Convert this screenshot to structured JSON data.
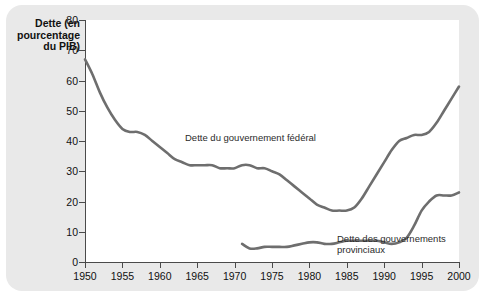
{
  "figure": {
    "background_color": "#e9e9e9",
    "plot_background_color": "#ffffff",
    "line_color": "#6e6e6e",
    "axis_color": "#4a4a4a"
  },
  "chart_data": {
    "type": "line",
    "title": "",
    "ylabel": "Dette (en pourcentage du PIB)",
    "xlabel": "",
    "xlim": [
      1950,
      2000
    ],
    "ylim": [
      0,
      80
    ],
    "grid": false,
    "legend": "inline-annotations",
    "ytick_labels": [
      "0",
      "10",
      "20",
      "30",
      "40",
      "50",
      "60",
      "70",
      "80"
    ],
    "ytick_values": [
      0,
      10,
      20,
      30,
      40,
      50,
      60,
      70,
      80
    ],
    "xtick_labels": [
      "1950",
      "1955",
      "1960",
      "1965",
      "1970",
      "1975",
      "1980",
      "1985",
      "1990",
      "1995",
      "2000"
    ],
    "xtick_values": [
      1950,
      1955,
      1960,
      1965,
      1970,
      1975,
      1980,
      1985,
      1990,
      1995,
      2000
    ],
    "annotations": [
      {
        "name": "federal-label",
        "text": "Dette du gouvernement fédéral",
        "x": 1968,
        "y": 50
      },
      {
        "name": "provincial-label",
        "text": "Dette des gouvernements\nprovinciaux",
        "x": 1989,
        "y": 11
      }
    ],
    "series": [
      {
        "name": "Dette du gouvernement fédéral",
        "x": [
          1950,
          1951,
          1952,
          1953,
          1954,
          1955,
          1956,
          1957,
          1958,
          1959,
          1960,
          1961,
          1962,
          1963,
          1964,
          1965,
          1966,
          1967,
          1968,
          1969,
          1970,
          1971,
          1972,
          1973,
          1974,
          1975,
          1976,
          1977,
          1978,
          1979,
          1980,
          1981,
          1982,
          1983,
          1984,
          1985,
          1986,
          1987,
          1988,
          1989,
          1990,
          1991,
          1992,
          1993,
          1994,
          1995,
          1996,
          1997,
          1998,
          1999,
          2000
        ],
        "values": [
          67,
          62,
          56,
          51,
          47,
          44,
          43,
          43,
          42,
          40,
          38,
          36,
          34,
          33,
          32,
          32,
          32,
          32,
          31,
          31,
          31,
          32,
          32,
          31,
          31,
          30,
          29,
          27,
          25,
          23,
          21,
          19,
          18,
          17,
          17,
          17,
          18,
          21,
          25,
          29,
          33,
          37,
          40,
          41,
          42,
          42,
          43,
          46,
          50,
          54,
          58
        ]
      },
      {
        "name": "Dette des gouvernements provinciaux",
        "x": [
          1971,
          1972,
          1973,
          1974,
          1975,
          1976,
          1977,
          1978,
          1979,
          1980,
          1981,
          1982,
          1983,
          1984,
          1985,
          1986,
          1987,
          1988,
          1989,
          1990,
          1991,
          1992,
          1993,
          1994,
          1995,
          1996,
          1997,
          1998,
          1999,
          2000
        ],
        "values": [
          6,
          4.5,
          4.5,
          5,
          5,
          5,
          5,
          5.5,
          6,
          6.5,
          6.5,
          6,
          6,
          6.5,
          7,
          7,
          7,
          7,
          7,
          6.5,
          6,
          6.5,
          8,
          12,
          17,
          20,
          22,
          22,
          22,
          23
        ]
      }
    ]
  },
  "federal_later": {
    "note": "peak around 1996"
  }
}
